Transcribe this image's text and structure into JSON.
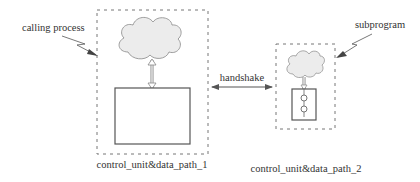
{
  "diagram": {
    "labels": {
      "calling_process": "calling process",
      "subprogram": "subprogram",
      "handshake": "handshake",
      "unit1": "control_unit&data_path_1",
      "unit2": "control_unit&data_path_2"
    },
    "colors": {
      "stroke": "#555555",
      "dashed": "#777777",
      "cloud_fill": "#ececec",
      "background": "#ffffff"
    }
  }
}
